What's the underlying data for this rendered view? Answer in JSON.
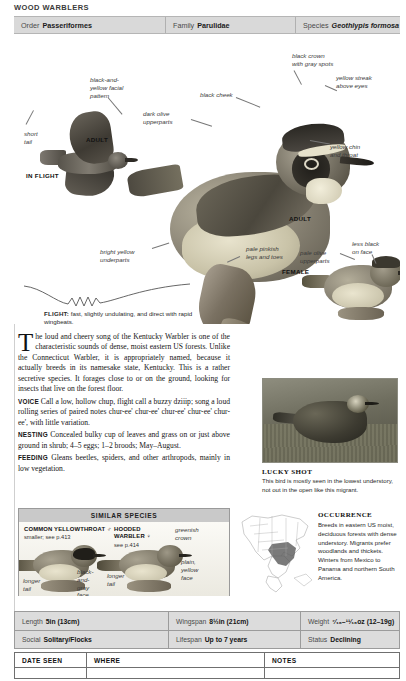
{
  "running_head": "WOOD WARBLERS",
  "taxonomy": [
    {
      "label": "Order",
      "value": "Passeriformes",
      "italic": false
    },
    {
      "label": "Family",
      "value": "Parulidae",
      "italic": false
    },
    {
      "label": "Species",
      "value": "Geothlypis formosa",
      "italic": true
    }
  ],
  "species_title": "Kentucky Warbler",
  "plate": {
    "callouts": [
      {
        "name": "black-and-yellow-facial-pattern",
        "text": "black-and-\nyellow facial\npattern"
      },
      {
        "name": "short-tail",
        "text": "short\ntail"
      },
      {
        "name": "dark-olive-upperparts",
        "text": "dark olive\nupperparts"
      },
      {
        "name": "black-cheek",
        "text": "black cheek"
      },
      {
        "name": "black-crown-with-gray-spots",
        "text": "black crown\nwith gray spots"
      },
      {
        "name": "yellow-streak-above-eyes",
        "text": "yellow streak\nabove eyes"
      },
      {
        "name": "yellow-chin-and-throat",
        "text": "yellow chin\nand throat"
      },
      {
        "name": "bright-yellow-underparts",
        "text": "bright yellow\nunderparts"
      },
      {
        "name": "pale-pinkish-legs-and-toes",
        "text": "pale pinkish\nlegs and toes"
      },
      {
        "name": "pale-olive-upperparts",
        "text": "pale olive\nupperparts"
      },
      {
        "name": "less-black-on-face",
        "text": "less black\non face"
      }
    ],
    "tags": [
      {
        "name": "tag-adult-flight",
        "text": "ADULT"
      },
      {
        "name": "tag-in-flight",
        "text": "IN FLIGHT"
      },
      {
        "name": "tag-adult-perched",
        "text": "ADULT"
      },
      {
        "name": "tag-female",
        "text": "FEMALE"
      }
    ]
  },
  "flight": {
    "label": "FLIGHT:",
    "text": " fast, slightly undulating, and direct with rapid wingbeats."
  },
  "body": {
    "dropcap": "T",
    "intro": "he loud and cheery song of the Kentucky Warbler is one of the characteristic sounds of dense, moist eastern US forests. Unlike the Connecticut Warbler, it is appropriately named, because it actually breeds in its namesake state, Kentucky. This is a rather secretive species. It forages close to or on the ground, looking for insects that live on the forest floor.",
    "sections": [
      {
        "label": "VOICE",
        "text": " Call a low, hollow chup, flight call a buzzy dziiip; song a loud rolling series of paired notes chur-ee' chur-ee' chur-ee' chur-ee' chur-ee', with little variation."
      },
      {
        "label": "NESTING",
        "text": " Concealed bulky cup of leaves and grass on or just above ground in shrub; 4–5 eggs; 1–2 broods; May–August."
      },
      {
        "label": "FEEDING",
        "text": " Gleans beetles, spiders, and other arthropods, mainly in low vegetation."
      }
    ]
  },
  "lucky_shot": {
    "title": "LUCKY SHOT",
    "caption": "This bird is mostly seen in the lowest understory, not out in the open like this migrant."
  },
  "similar_species": {
    "heading": "SIMILAR SPECIES",
    "items": [
      {
        "name": "Common Yellowthroat",
        "display_name": "COMMON YELLOWTHROAT ♂",
        "sub": "smaller; see p.413",
        "callouts": [
          {
            "name": "longer-tail",
            "text": "longer\ntail"
          },
          {
            "name": "black-and-gray-face",
            "text": "black-\nand-\ngray\nface"
          }
        ]
      },
      {
        "name": "Hooded Warbler",
        "display_name": "HOODED\nWARBLER ♀",
        "sub": "see p.414",
        "callouts": [
          {
            "name": "greenish-crown",
            "text": "greenish\ncrown"
          },
          {
            "name": "plain-yellow-face",
            "text": "plain,\nyellow\nface"
          },
          {
            "name": "longer-tail",
            "text": "longer\ntail"
          }
        ]
      }
    ]
  },
  "occurrence": {
    "title": "OCCURRENCE",
    "text": "Breeds in eastern US moist, deciduous forests with dense understory. Migrants prefer woodlands and thickets. Winters from Mexico to Panama and northern South America."
  },
  "stats": [
    [
      {
        "label": "Length",
        "value": "5in (13cm)"
      },
      {
        "label": "Wingspan",
        "value": "8½in (21cm)"
      },
      {
        "label": "Weight",
        "value": "⁷⁄₁₆–¹¹⁄₁₆oz (12–19g)"
      }
    ],
    [
      {
        "label": "Social",
        "value": "Solitary/Flocks"
      },
      {
        "label": "Lifespan",
        "value": "Up to 7 years"
      },
      {
        "label": "Status",
        "value": "Declining"
      }
    ]
  ],
  "log": {
    "headers": [
      "DATE SEEN",
      "WHERE",
      "NOTES"
    ]
  },
  "colors": {
    "bar_gray": "#d9d9d9",
    "stats_gray": "#dcdcdc",
    "simsp_header": "#c9c9c9",
    "map_range": "#5d5d5d"
  }
}
